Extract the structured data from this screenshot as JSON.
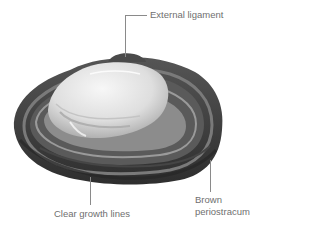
{
  "figure": {
    "labels": {
      "external_ligament": "External ligament",
      "brown_periostracum_line1": "Brown",
      "brown_periostracum_line2": "periostracum",
      "clear_growth_lines": "Clear growth lines"
    },
    "colors": {
      "background": "#ffffff",
      "label_text": "#6f6f6f",
      "leader_line": "#8a8a8a",
      "shell_dark": "#3a3a3a",
      "shell_mid": "#6e6e6e",
      "shell_light": "#e8e8e8",
      "umbo_highlight": "#f5f5f5"
    }
  }
}
